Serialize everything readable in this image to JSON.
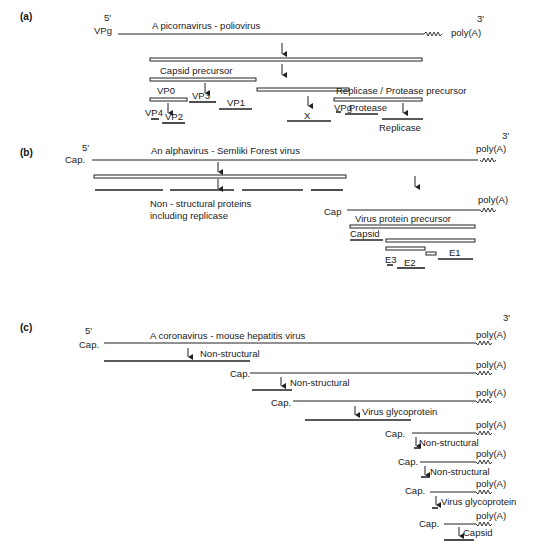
{
  "panels": {
    "a": {
      "label": "(a)",
      "five_prime": "5'",
      "five_end": "VPg",
      "title": "A picornavirus - poliovirus",
      "three_prime": "3'",
      "poly_a": "poly(A)",
      "capsid_precursor": "Capsid precursor",
      "repl_prot_precursor": "Replicase / Protease precursor",
      "vp0": "VP0",
      "vp3": "VP3",
      "vp1": "VP1",
      "vp4": "VP4",
      "vp2": "VP2",
      "x": "X",
      "vpg": "VPg",
      "protease": "Protease",
      "replicase": "Replicase"
    },
    "b": {
      "label": "(b)",
      "five_prime": "5'",
      "five_end": "Cap.",
      "title": "An alphavirus - Semliki Forest virus",
      "three_prime": "3'",
      "poly_a": "poly(A)",
      "nonstructural_line1": "Non - structural proteins",
      "nonstructural_line2": "including replicase",
      "cap": "Cap",
      "poly_a_2": "poly(A)",
      "virus_protein_precursor": "Virus protein precursor",
      "capsid": "Capsid",
      "e1": "E1",
      "e2": "E2",
      "e3": "E3"
    },
    "c": {
      "label": "(c)",
      "five_prime": "5'",
      "title": "A coronavirus - mouse hepatitis virus",
      "three_prime": "3'",
      "mrnas": [
        {
          "cap": "Cap.",
          "poly_a": "poly(A)",
          "product": "Non-structural"
        },
        {
          "cap": "Cap.",
          "poly_a": "poly(A)",
          "product": "Non-structural"
        },
        {
          "cap": "Cap.",
          "poly_a": "poly(A)",
          "product": "Virus glycoprotein"
        },
        {
          "cap": "Cap.",
          "poly_a": "poly(A)",
          "product": "Non-structural"
        },
        {
          "cap": "Cap.",
          "poly_a": "poly(A)",
          "product": "Non-structural"
        },
        {
          "cap": "Cap.",
          "poly_a": "poly(A)",
          "product": "Virus glycoprotein"
        },
        {
          "cap": "Cap.",
          "poly_a": "poly(A)",
          "product": "Capsid"
        }
      ]
    }
  }
}
